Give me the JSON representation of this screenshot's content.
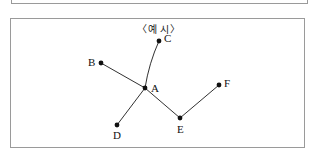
{
  "figure": {
    "title": "〈예  시〉",
    "border_color": "#9a9a9a",
    "background_color": "#ffffff",
    "ink_color": "#111111"
  },
  "top_fragment": {
    "present": true
  },
  "chart_data": {
    "type": "diagram",
    "subtype": "node-link-graph",
    "title": "〈예  시〉",
    "nodes": [
      {
        "id": "A",
        "label": "A",
        "x": 134,
        "y": 69,
        "label_dx": 6,
        "label_dy": 4
      },
      {
        "id": "B",
        "label": "B",
        "x": 90,
        "y": 44,
        "label_dx": -13,
        "label_dy": 3
      },
      {
        "id": "C",
        "label": "C",
        "x": 148,
        "y": 22,
        "label_dx": 5,
        "label_dy": 1
      },
      {
        "id": "D",
        "label": "D",
        "x": 106,
        "y": 106,
        "label_dx": -4,
        "label_dy": 14
      },
      {
        "id": "E",
        "label": "E",
        "x": 169,
        "y": 99,
        "label_dx": -3,
        "label_dy": 15
      },
      {
        "id": "F",
        "label": "F",
        "x": 208,
        "y": 66,
        "label_dx": 5,
        "label_dy": 2
      }
    ],
    "edges": [
      {
        "from": "B",
        "to": "A",
        "curved": false
      },
      {
        "from": "A",
        "to": "C",
        "curved": true,
        "control_x": 138,
        "control_y": 44
      },
      {
        "from": "A",
        "to": "D",
        "curved": false
      },
      {
        "from": "A",
        "to": "E",
        "curved": false
      },
      {
        "from": "E",
        "to": "F",
        "curved": false
      }
    ],
    "node_radius": 2.4,
    "degrees": {
      "A": 4,
      "B": 1,
      "C": 1,
      "D": 1,
      "E": 2,
      "F": 1
    }
  }
}
